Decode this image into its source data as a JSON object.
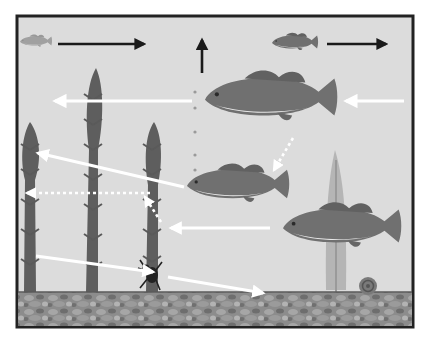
{
  "colors": {
    "background": "#ffffff",
    "water": "#dcdcdc",
    "frame": "#222222",
    "plant_dark": "#5a5a5a",
    "plant_light": "#b9b9b9",
    "fish": "#6f6f6f",
    "fish_belly": "#e6e6e6",
    "gravel": "#8a8a8a",
    "arrow_black": "#1a1a1a",
    "arrow_white": "#ffffff"
  },
  "elements": {
    "fish": [
      {
        "id": "small-fish-left",
        "label": "small faded fish (top left)"
      },
      {
        "id": "small-fish-right",
        "label": "small bass (top right)"
      },
      {
        "id": "large-bass",
        "label": "large bass (upper middle)"
      },
      {
        "id": "medium-bass",
        "label": "medium bass (middle)"
      },
      {
        "id": "lower-bass",
        "label": "bass (lower right)"
      }
    ],
    "plants": [
      {
        "id": "plant-left",
        "label": "tall aquatic plant (far left)"
      },
      {
        "id": "plant-middle-left",
        "label": "tall aquatic plant (middle left)"
      },
      {
        "id": "plant-middle",
        "label": "aquatic plant (middle)"
      },
      {
        "id": "plant-right",
        "label": "pale aquatic plant (right)"
      }
    ],
    "invertebrates": [
      {
        "id": "insect",
        "label": "aquatic insect"
      },
      {
        "id": "snail",
        "label": "snail"
      }
    ],
    "arrows": {
      "black": [
        {
          "id": "arrow-black-top-left",
          "direction": "right"
        },
        {
          "id": "arrow-black-up",
          "direction": "up"
        },
        {
          "id": "arrow-black-top-right",
          "direction": "right"
        }
      ],
      "white_solid": [
        {
          "id": "arrow-large-bass-left",
          "direction": "left"
        },
        {
          "id": "arrow-into-large-bass",
          "direction": "left"
        },
        {
          "id": "arrow-medium-bass-to-plant",
          "direction": "up-left"
        },
        {
          "id": "arrow-lower-bass-left",
          "direction": "left"
        },
        {
          "id": "arrow-plant-to-insect",
          "direction": "down-right"
        },
        {
          "id": "arrow-insect-to-gravel",
          "direction": "down-right"
        }
      ],
      "white_dotted": [
        {
          "id": "dotted-arrow-large-to-medium",
          "direction": "down-left"
        },
        {
          "id": "dotted-arrow-horizontal-left",
          "direction": "left"
        },
        {
          "id": "dotted-arrow-diagonal",
          "direction": "up-left"
        }
      ]
    },
    "dot_trail": {
      "id": "bubble-trail",
      "label": "vertical trail of dots"
    },
    "substrate": {
      "id": "gravel-bed",
      "label": "gravel lake bottom"
    }
  }
}
